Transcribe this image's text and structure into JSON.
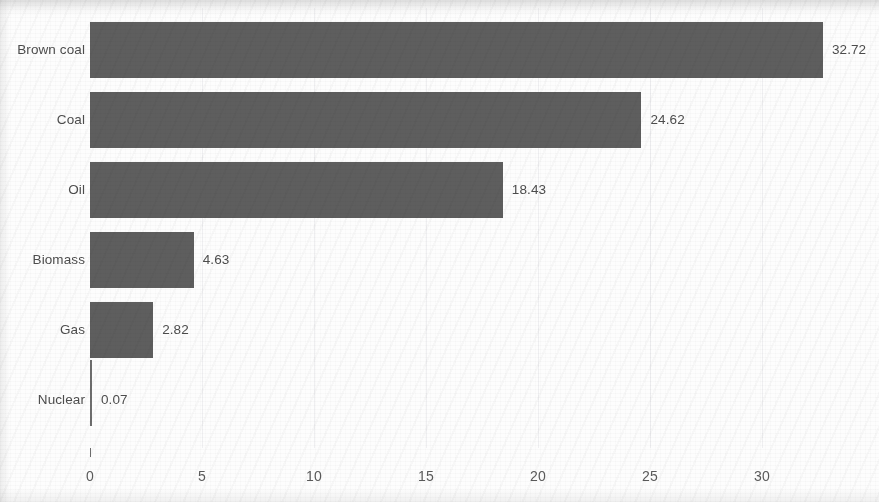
{
  "chart_data": {
    "type": "bar",
    "orientation": "horizontal",
    "title": "",
    "subtitle": "",
    "xlabel": "",
    "ylabel": "",
    "categories": [
      "Brown coal",
      "Coal",
      "Oil",
      "Biomass",
      "Gas",
      "Nuclear"
    ],
    "values": [
      32.72,
      24.62,
      18.43,
      4.63,
      2.82,
      0.07
    ],
    "value_labels": [
      "32.72",
      "24.62",
      "18.43",
      "4.63",
      "2.82",
      "0.07"
    ],
    "xlim": [
      0,
      35.2
    ],
    "xticks": [
      0,
      5,
      10,
      15,
      20,
      25,
      30
    ],
    "xtick_labels": [
      "0",
      "5",
      "10",
      "15",
      "20",
      "25",
      "30"
    ],
    "grid": true,
    "legend": false,
    "bar_color": "#5e5e5e",
    "text_color": "#4d4d4d",
    "background_color": "#fdfdfd"
  },
  "axis": {
    "ticks": [
      {
        "label": "0",
        "value": 0
      },
      {
        "label": "5",
        "value": 5
      },
      {
        "label": "10",
        "value": 10
      },
      {
        "label": "15",
        "value": 15
      },
      {
        "label": "20",
        "value": 20
      },
      {
        "label": "25",
        "value": 25
      },
      {
        "label": "30",
        "value": 30
      }
    ]
  },
  "bars": [
    {
      "category": "Brown coal",
      "value": 32.72,
      "label": "32.72"
    },
    {
      "category": "Coal",
      "value": 24.62,
      "label": "24.62"
    },
    {
      "category": "Oil",
      "value": 18.43,
      "label": "18.43"
    },
    {
      "category": "Biomass",
      "value": 4.63,
      "label": "4.63"
    },
    {
      "category": "Gas",
      "value": 2.82,
      "label": "2.82"
    },
    {
      "category": "Nuclear",
      "value": 0.07,
      "label": "0.07"
    }
  ]
}
